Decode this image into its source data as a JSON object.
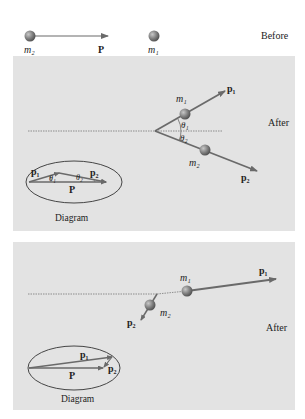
{
  "before": {
    "label": "Before",
    "m2": "m₂",
    "P": "P",
    "m1": "m₁"
  },
  "after1": {
    "label": "After",
    "m1": "m₁",
    "m2": "m₂",
    "p1": "p₁",
    "p2": "p₂",
    "theta1": "θ₁",
    "theta2": "θ₂",
    "diagram": {
      "p1": "p₁",
      "p2": "p₂",
      "P": "P",
      "theta1": "θ₁",
      "theta2": "θ₂",
      "caption": "Diagram"
    }
  },
  "after2": {
    "label": "After",
    "m1": "m₁",
    "m2": "m₂",
    "p1": "p₁",
    "p2": "p₂",
    "diagram": {
      "p1": "p₁",
      "p2": "p₂",
      "P": "P",
      "caption": "Diagram"
    }
  },
  "colors": {
    "panel": "#e3e3e3",
    "arrow": "#6a6a6a",
    "ball": "#7d7d7d",
    "text": "#222222"
  }
}
